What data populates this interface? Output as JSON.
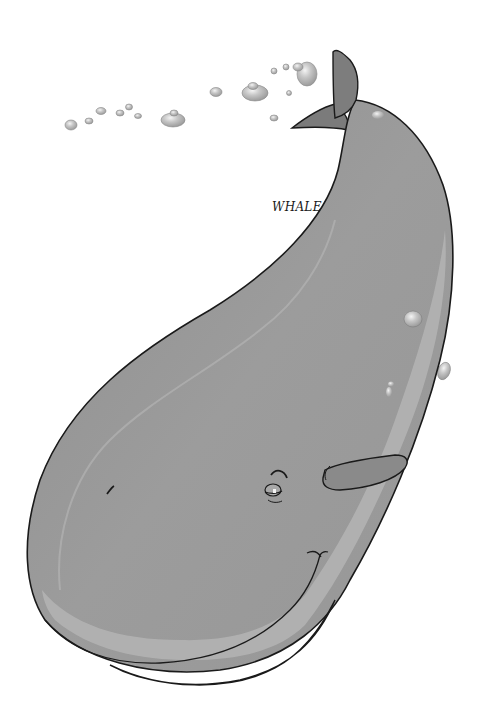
{
  "illustration": {
    "subject": "whale",
    "label": "WHALE",
    "colors": {
      "background": "#ffffff",
      "body": "#9a9a9a",
      "body_dark": "#858585",
      "belly": "#b4b4b4",
      "tail": "#7e7e7e",
      "outline": "#1a1a1a",
      "bubble": "#c8c8c8",
      "bubble_highlight": "#f2f2f2"
    },
    "parts": [
      "tail-fluke",
      "body",
      "belly-band",
      "flipper",
      "eye",
      "mouth",
      "blowhole",
      "bubbles"
    ]
  }
}
